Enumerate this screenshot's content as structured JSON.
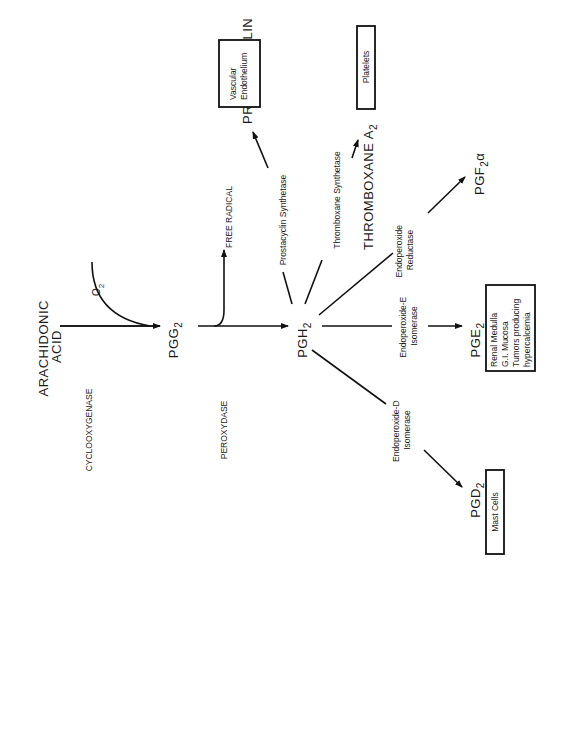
{
  "diagram": {
    "nodes": {
      "arachidonic_acid": [
        "ARACHIDONIC",
        "ACID"
      ],
      "o2": "O",
      "o2_sub": "2",
      "pgg2": "PGG",
      "pgg2_sub": "2",
      "free_radical": "FREE  RADICAL",
      "pgh2": "PGH",
      "pgh2_sub": "2",
      "prostacyclin": "PROSTACYCLIN",
      "thromboxane": "THROMBOXANE  A",
      "thromboxane_sub": "2",
      "pgf2a": "PGF",
      "pgf2a_sub": "2",
      "pgf2a_alpha": "α",
      "pge2": "PGE",
      "pge2_sub": "2",
      "pgd2": "PGD",
      "pgd2_sub": "2"
    },
    "enzymes": {
      "cyclooxygenase": "CYCLOOXYGENASE",
      "peroxydase": "PEROXYDASE",
      "prostacyclin_synthetase": "Prostacyclin Synthetase",
      "thromboxane_synthetase": "Thromboxane Synthetase",
      "endoperoxide_reductase": [
        "Endoperoxide",
        "Reductase"
      ],
      "endoperoxide_e_isomerase": [
        "Endoperoxide-E",
        "Isomerase"
      ],
      "endoperoxide_d_isomerase": [
        "Endoperoxide-D",
        "Isomerase"
      ]
    },
    "tissues": {
      "vascular_endothelium": [
        "Vascular",
        "Endothelium"
      ],
      "platelets": "Platelets",
      "pge2_sources": [
        "Renal Medulla",
        "G.I. Mucosa",
        "Tumors producing",
        "hypercalcemia"
      ],
      "mast_cells": "Mast Cells"
    }
  }
}
